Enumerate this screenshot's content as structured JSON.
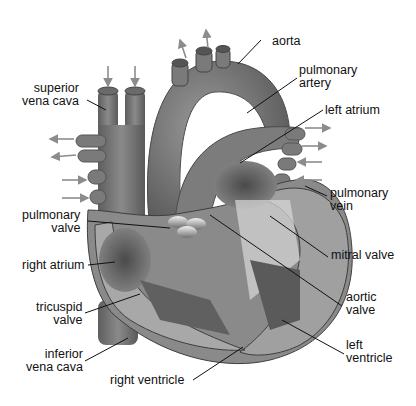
{
  "diagram": {
    "colors": {
      "background": "#ffffff",
      "tissue_dark": "#5a5a5a",
      "tissue_mid": "#808080",
      "tissue_light": "#b0b0b0",
      "muscle_wall": "#9a9a9a",
      "arrow": "#8c8c8c",
      "leader_line": "#111111",
      "label_text": "#111111"
    },
    "labels": {
      "aorta": "aorta",
      "pulmonary_artery": "pulmonary\nartery",
      "left_atrium": "left atrium",
      "pulmonary_vein": "pulmonary\nvein",
      "mitral_valve": "mitral valve",
      "aortic_valve": "aortic\nvalve",
      "left_ventricle": "left\nventricle",
      "right_ventricle": "right ventricle",
      "inferior_vena_cava": "inferior\nvena cava",
      "tricuspid_valve": "tricuspid\nvalve",
      "right_atrium": "right atrium",
      "pulmonary_valve": "pulmonary\nvalve",
      "superior_vena_cava": "superior\nvena cava"
    }
  }
}
